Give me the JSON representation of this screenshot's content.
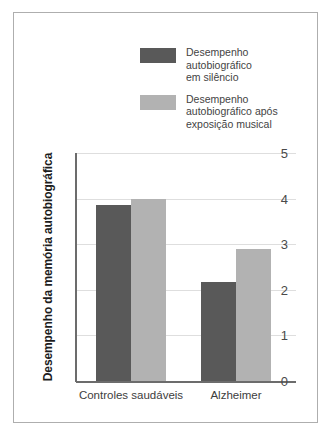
{
  "chart_data": {
    "type": "bar",
    "title": "",
    "xlabel": "",
    "ylabel": "Desempenho da memória autobiográfica",
    "categories": [
      "Controles saudáveis",
      "Alzheimer"
    ],
    "series": [
      {
        "name": "Desempenho autobiográfico em silêncio",
        "color": "#595959",
        "values": [
          3.87,
          2.17
        ]
      },
      {
        "name": "Desempenho autobiográfico após exposição musical",
        "color": "#b2b2b2",
        "values": [
          4.0,
          2.9
        ]
      }
    ],
    "ylim": [
      0,
      5
    ],
    "yticks": [
      "0",
      "1",
      "2",
      "3",
      "4",
      "5"
    ],
    "grid": true,
    "legend_position": "top-center"
  },
  "legend": {
    "items": [
      {
        "label": "Desempenho\nautobiográfico\nem silêncio",
        "swatch": "dark"
      },
      {
        "label": "Desempenho\nautobiográfico após\nexposição musical",
        "swatch": "light"
      }
    ]
  },
  "axis": {
    "ylabel": "Desempenho da memória autobiográfica",
    "ytick_0": "0",
    "ytick_1": "1",
    "ytick_2": "2",
    "ytick_3": "3",
    "ytick_4": "4",
    "ytick_5": "5",
    "xtick_0": "Controles saudáveis",
    "xtick_1": "Alzheimer"
  }
}
